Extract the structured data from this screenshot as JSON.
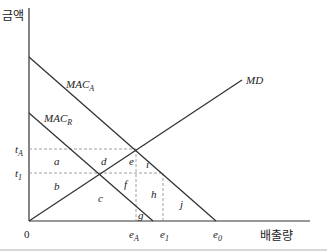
{
  "axes": {
    "y_label": "금액",
    "x_label": "배출량",
    "origin": "0"
  },
  "curves": {
    "mac_a": {
      "name": "MAC",
      "sub": "A"
    },
    "mac_r": {
      "name": "MAC",
      "sub": "R"
    },
    "md": {
      "name": "MD"
    }
  },
  "y_ticks": [
    {
      "name": "t",
      "sub": "A"
    },
    {
      "name": "t",
      "sub": "1"
    }
  ],
  "x_ticks": [
    {
      "name": "e",
      "sub": "A"
    },
    {
      "name": "e",
      "sub": "1"
    },
    {
      "name": "e",
      "sub": "0"
    }
  ],
  "regions": [
    "a",
    "b",
    "c",
    "d",
    "e",
    "f",
    "g",
    "h",
    "i",
    "j"
  ],
  "colors": {
    "line": "#333333",
    "dash": "#888888",
    "text": "#222222"
  }
}
